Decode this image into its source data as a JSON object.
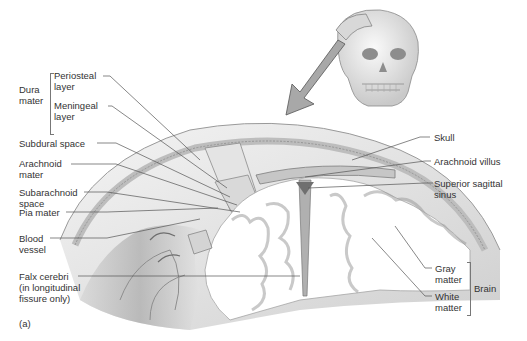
{
  "figure": {
    "panel_label": "(a)",
    "orienting_icon": "skull-icon",
    "arrow": "pointer-arrow-icon"
  },
  "labels_left": {
    "dura_mater": {
      "group": "Dura\nmater",
      "group_line1": "Dura",
      "group_line2": "mater"
    },
    "periosteal": {
      "line1": "Periosteal",
      "line2": "layer"
    },
    "meningeal": {
      "line1": "Meningeal",
      "line2": "layer"
    },
    "subdural": {
      "line1": "Subdural space"
    },
    "arachnoid": {
      "line1": "Arachnoid",
      "line2": "mater"
    },
    "subarachnoid": {
      "line1": "Subarachnoid",
      "line2": "space"
    },
    "pia": {
      "line1": "Pia mater"
    },
    "blood_vessel": {
      "line1": "Blood",
      "line2": "vessel"
    },
    "falx": {
      "line1": "Falx cerebri",
      "line2": "(in longitudinal",
      "line3": "fissure only)"
    }
  },
  "labels_right": {
    "skull": {
      "line1": "Skull"
    },
    "arachnoid_villus": {
      "line1": "Arachnoid villus"
    },
    "superior_sagittal": {
      "line1": "Superior sagittal",
      "line2": "sinus"
    },
    "gray": {
      "line1": "Gray",
      "line2": "matter"
    },
    "white": {
      "line1": "White",
      "line2": "matter"
    },
    "brain": {
      "group": "Brain"
    }
  },
  "colors": {
    "background": "#ffffff",
    "leader_line": "#555555",
    "tissue_light": "#ececec",
    "tissue_mid": "#bdbdbd",
    "tissue_dark": "#7a7a7a",
    "arrow_fill": "#a8a8a8"
  }
}
